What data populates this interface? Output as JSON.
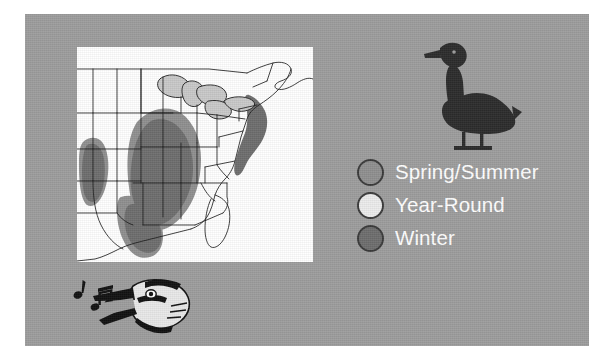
{
  "figure": {
    "background_color": "#ffffff",
    "panel_color": "#9d9d9d"
  },
  "map": {
    "name": "eastern-united-states-range-map",
    "background_color": "#ffffff",
    "outline_color": "#1a1a1a",
    "water_color": "#c9c9c9",
    "regions": [
      {
        "key": "spring_summer",
        "label": "Spring/Summer",
        "color": "#8f8f8f"
      },
      {
        "key": "year_round",
        "label": "Year-Round",
        "color": "#e6e6e6"
      },
      {
        "key": "winter",
        "label": "Winter",
        "color": "#6e6e6e"
      }
    ]
  },
  "legend": {
    "name": "seasonal-range-legend",
    "text_color": "#ffffff",
    "outline_color": "#3a3a3a",
    "items": [
      {
        "label": "Spring/Summer",
        "color": "#8f8f8f"
      },
      {
        "label": "Year-Round",
        "color": "#ececec"
      },
      {
        "label": "Winter",
        "color": "#6e6e6e"
      }
    ]
  },
  "illustrations": {
    "goose": {
      "name": "goose-silhouette",
      "color": "#2b2b2b"
    },
    "songbird": {
      "name": "singing-bird-head",
      "color": "#111111",
      "notes": 2
    }
  }
}
